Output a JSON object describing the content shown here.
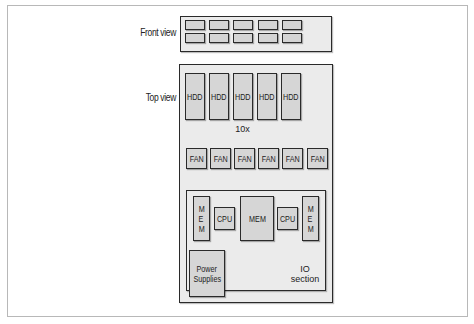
{
  "diagram": {
    "front_view": {
      "label": "Front view",
      "rows": 2,
      "slots_per_row": 5
    },
    "top_view": {
      "label": "Top view",
      "hdd": {
        "label": "HDD",
        "count_shown": 5,
        "multiplier_label": "10x"
      },
      "fans": {
        "label": "FAN",
        "count": 6
      },
      "io_section": {
        "label_line1": "IO",
        "label_line2": "section",
        "mem_left": [
          "M",
          "E",
          "M"
        ],
        "cpu_left": "CPU",
        "mem_center": "MEM",
        "cpu_right": "CPU",
        "mem_right": [
          "M",
          "E",
          "M"
        ],
        "power_supplies_line1": "Power",
        "power_supplies_line2": "Supplies"
      }
    },
    "colors": {
      "panel_fill": "#ebebeb",
      "component_fill": "#d6d6d6",
      "outline": "#2a2a2a",
      "frame_border": "#b8b8b8"
    }
  }
}
